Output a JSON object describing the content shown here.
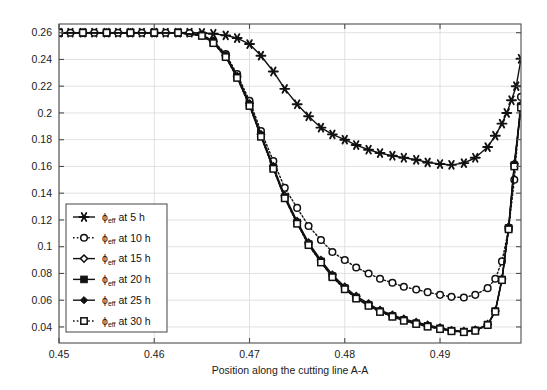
{
  "chart_data": {
    "type": "line",
    "title": "",
    "xlabel": "Position along the cutting line A-A",
    "ylabel": "",
    "xlim": [
      0.45,
      0.4985
    ],
    "ylim": [
      0.028,
      0.2665
    ],
    "grid": true,
    "legend_position": "center-left",
    "xticks": [
      "0.45",
      "0.46",
      "0.47",
      "0.48",
      "0.49"
    ],
    "xtick_values": [
      0.45,
      0.46,
      0.47,
      0.48,
      0.49
    ],
    "yticks": [
      "0.04",
      "0.06",
      "0.08",
      "0.1",
      "0.12",
      "0.14",
      "0.16",
      "0.18",
      "0.2",
      "0.22",
      "0.24",
      "0.26"
    ],
    "ytick_values": [
      0.04,
      0.06,
      0.08,
      0.1,
      0.12,
      0.14,
      0.16,
      0.18,
      0.2,
      0.22,
      0.24,
      0.26
    ],
    "series": [
      {
        "name": "phi_eff at 5 h",
        "legend_label": "at 5 h",
        "symbol": "ϕ",
        "subscript": "eff",
        "marker": "star",
        "linestyle": "solid",
        "color": "#111111",
        "x": [
          0.45,
          0.4512,
          0.4525,
          0.4537,
          0.455,
          0.4562,
          0.4575,
          0.4587,
          0.46,
          0.4612,
          0.4625,
          0.4637,
          0.465,
          0.4662,
          0.4675,
          0.4687,
          0.47,
          0.4712,
          0.4725,
          0.4737,
          0.475,
          0.4762,
          0.4775,
          0.4787,
          0.48,
          0.4812,
          0.4825,
          0.4837,
          0.485,
          0.4862,
          0.4875,
          0.4887,
          0.49,
          0.4912,
          0.4925,
          0.4937,
          0.495,
          0.4958,
          0.4965,
          0.497,
          0.4975,
          0.498,
          0.4985
        ],
        "y": [
          0.26,
          0.26,
          0.26,
          0.26,
          0.26,
          0.26,
          0.26,
          0.26,
          0.26,
          0.26,
          0.26,
          0.26,
          0.2598,
          0.2592,
          0.258,
          0.256,
          0.2515,
          0.2428,
          0.231,
          0.218,
          0.2065,
          0.1975,
          0.189,
          0.184,
          0.18,
          0.176,
          0.1725,
          0.17,
          0.168,
          0.1665,
          0.165,
          0.163,
          0.1618,
          0.1612,
          0.1625,
          0.1665,
          0.1745,
          0.183,
          0.192,
          0.2,
          0.2095,
          0.22,
          0.2405
        ]
      },
      {
        "name": "phi_eff at 10 h",
        "legend_label": "at 10 h",
        "symbol": "ϕ",
        "subscript": "eff",
        "marker": "circle-open",
        "linestyle": "dotted",
        "color": "#111111",
        "x": [
          0.45,
          0.4512,
          0.4525,
          0.4537,
          0.455,
          0.4562,
          0.4575,
          0.4587,
          0.46,
          0.4612,
          0.4625,
          0.4637,
          0.465,
          0.4662,
          0.4675,
          0.4687,
          0.47,
          0.4712,
          0.4725,
          0.4737,
          0.475,
          0.4762,
          0.4775,
          0.4787,
          0.48,
          0.4812,
          0.4825,
          0.4837,
          0.485,
          0.4862,
          0.4875,
          0.4887,
          0.49,
          0.4912,
          0.4925,
          0.4937,
          0.495,
          0.4958,
          0.4965,
          0.4972,
          0.4978,
          0.4985
        ],
        "y": [
          0.26,
          0.26,
          0.26,
          0.26,
          0.26,
          0.26,
          0.26,
          0.26,
          0.26,
          0.26,
          0.26,
          0.2598,
          0.2585,
          0.254,
          0.244,
          0.229,
          0.209,
          0.1865,
          0.164,
          0.144,
          0.129,
          0.1155,
          0.105,
          0.096,
          0.09,
          0.0845,
          0.08,
          0.076,
          0.073,
          0.07,
          0.068,
          0.066,
          0.064,
          0.0625,
          0.062,
          0.064,
          0.069,
          0.076,
          0.089,
          0.113,
          0.15,
          0.212
        ]
      },
      {
        "name": "phi_eff at 15 h",
        "legend_label": "at 15 h",
        "symbol": "ϕ",
        "subscript": "eff",
        "marker": "diamond-open",
        "linestyle": "solid",
        "color": "#111111",
        "x": [
          0.45,
          0.4525,
          0.455,
          0.4575,
          0.46,
          0.4625,
          0.465,
          0.4662,
          0.4675,
          0.4687,
          0.47,
          0.4712,
          0.4725,
          0.4737,
          0.475,
          0.4762,
          0.4775,
          0.4787,
          0.48,
          0.4812,
          0.4825,
          0.4837,
          0.485,
          0.4862,
          0.4875,
          0.4887,
          0.49,
          0.4912,
          0.4925,
          0.4937,
          0.495,
          0.4958,
          0.4965,
          0.4972,
          0.4978,
          0.4985
        ],
        "y": [
          0.26,
          0.26,
          0.26,
          0.26,
          0.26,
          0.26,
          0.2582,
          0.2535,
          0.243,
          0.2275,
          0.207,
          0.184,
          0.16,
          0.138,
          0.119,
          0.103,
          0.09,
          0.079,
          0.07,
          0.063,
          0.0575,
          0.0525,
          0.049,
          0.046,
          0.0435,
          0.0415,
          0.0395,
          0.0375,
          0.0368,
          0.0378,
          0.042,
          0.052,
          0.076,
          0.115,
          0.162,
          0.206
        ]
      },
      {
        "name": "phi_eff at 20 h",
        "legend_label": "at 20 h",
        "symbol": "ϕ",
        "subscript": "eff",
        "marker": "square-filled",
        "linestyle": "solid",
        "color": "#111111",
        "x": [
          0.45,
          0.4525,
          0.455,
          0.4575,
          0.46,
          0.4625,
          0.465,
          0.4662,
          0.4675,
          0.4687,
          0.47,
          0.4712,
          0.4725,
          0.4737,
          0.475,
          0.4762,
          0.4775,
          0.4787,
          0.48,
          0.4812,
          0.4825,
          0.4837,
          0.485,
          0.4862,
          0.4875,
          0.4887,
          0.49,
          0.4912,
          0.4925,
          0.4937,
          0.495,
          0.4958,
          0.4965,
          0.4972,
          0.4978,
          0.4985
        ],
        "y": [
          0.26,
          0.26,
          0.26,
          0.26,
          0.26,
          0.26,
          0.258,
          0.253,
          0.2425,
          0.227,
          0.206,
          0.183,
          0.159,
          0.137,
          0.118,
          0.102,
          0.089,
          0.078,
          0.069,
          0.062,
          0.0565,
          0.0518,
          0.0482,
          0.0452,
          0.0428,
          0.0408,
          0.039,
          0.0372,
          0.0365,
          0.0375,
          0.0418,
          0.0518,
          0.0755,
          0.114,
          0.161,
          0.205
        ]
      },
      {
        "name": "phi_eff at 25 h",
        "legend_label": "at 25 h",
        "symbol": "ϕ",
        "subscript": "eff",
        "marker": "diamond-filled",
        "linestyle": "solid",
        "color": "#111111",
        "x": [
          0.45,
          0.4525,
          0.455,
          0.4575,
          0.46,
          0.4625,
          0.465,
          0.4662,
          0.4675,
          0.4687,
          0.47,
          0.4712,
          0.4725,
          0.4737,
          0.475,
          0.4762,
          0.4775,
          0.4787,
          0.48,
          0.4812,
          0.4825,
          0.4837,
          0.485,
          0.4862,
          0.4875,
          0.4887,
          0.49,
          0.4912,
          0.4925,
          0.4937,
          0.495,
          0.4958,
          0.4965,
          0.4972,
          0.4978,
          0.4985
        ],
        "y": [
          0.26,
          0.26,
          0.26,
          0.26,
          0.26,
          0.26,
          0.2578,
          0.2525,
          0.242,
          0.2265,
          0.2055,
          0.1825,
          0.1585,
          0.1365,
          0.1175,
          0.1015,
          0.0885,
          0.0775,
          0.0685,
          0.0615,
          0.056,
          0.0514,
          0.0478,
          0.0448,
          0.0424,
          0.0404,
          0.0386,
          0.037,
          0.0363,
          0.0373,
          0.0416,
          0.0516,
          0.0752,
          0.1135,
          0.1605,
          0.2045
        ]
      },
      {
        "name": "phi_eff at 30 h",
        "legend_label": "at 30 h",
        "symbol": "ϕ",
        "subscript": "eff",
        "marker": "square-open",
        "linestyle": "dotted",
        "color": "#111111",
        "x": [
          0.45,
          0.4525,
          0.455,
          0.4575,
          0.46,
          0.4625,
          0.465,
          0.4662,
          0.4675,
          0.4687,
          0.47,
          0.4712,
          0.4725,
          0.4737,
          0.475,
          0.4762,
          0.4775,
          0.4787,
          0.48,
          0.4812,
          0.4825,
          0.4837,
          0.485,
          0.4862,
          0.4875,
          0.4887,
          0.49,
          0.4912,
          0.4925,
          0.4937,
          0.495,
          0.4958,
          0.4965,
          0.4972,
          0.4978,
          0.4985
        ],
        "y": [
          0.26,
          0.26,
          0.26,
          0.26,
          0.26,
          0.26,
          0.2576,
          0.2522,
          0.2418,
          0.2262,
          0.2052,
          0.1822,
          0.1582,
          0.1362,
          0.1172,
          0.1012,
          0.0882,
          0.0772,
          0.0682,
          0.0612,
          0.0558,
          0.0512,
          0.0476,
          0.0446,
          0.0422,
          0.0402,
          0.0384,
          0.0368,
          0.0361,
          0.0371,
          0.0414,
          0.0514,
          0.075,
          0.113,
          0.16,
          0.204
        ]
      }
    ]
  },
  "colors": {
    "line": "#111111",
    "axis": "#4d4d4d",
    "grid": "#d9d9d9",
    "background": "#ffffff",
    "legend_border": "#555555"
  }
}
